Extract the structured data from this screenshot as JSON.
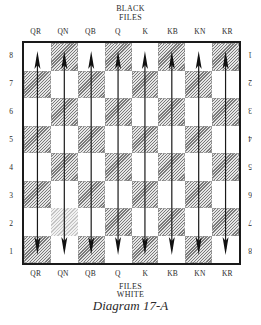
{
  "top": {
    "line1": "BLACK",
    "line2": "FILES",
    "files": [
      "QR",
      "QN",
      "QB",
      "Q",
      "K",
      "KB",
      "KN",
      "KR"
    ]
  },
  "bottom": {
    "files": [
      "QR",
      "QN",
      "QB",
      "Q",
      "K",
      "KB",
      "KN",
      "KR"
    ],
    "line1": "FILES",
    "line2": "WHITE"
  },
  "ranks_left": [
    "8",
    "7",
    "6",
    "5",
    "4",
    "3",
    "2",
    "1"
  ],
  "ranks_right": [
    "1",
    "2",
    "3",
    "4",
    "5",
    "6",
    "7",
    "8"
  ],
  "caption": "Diagram 17-A",
  "board": {
    "rows": 8,
    "cols": 8,
    "top_left_square": "light",
    "faint_square": {
      "row": 6,
      "col": 1
    },
    "arrows": "double-headed vertical arrow along each of the 8 files",
    "colors": {
      "border": "#1a1a1a",
      "hatch": "#7a7a7a",
      "light": "#ffffff",
      "arrow": "#1a1a1a"
    }
  }
}
